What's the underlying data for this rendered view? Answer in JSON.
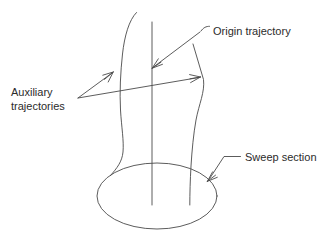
{
  "figure": {
    "type": "engineering-diagram",
    "background_color": "#ffffff",
    "line_color": "#4a4a4a",
    "text_color": "#2b2b2b"
  },
  "labels": {
    "origin_trajectory": "Origin trajectory",
    "auxiliary_line1": "Auxiliary",
    "auxiliary_line2": "trajectories",
    "sweep_section": "Sweep section"
  },
  "geometry": {
    "origin_trajectory_line": "vertical centre line from (152,22) to (152,205)",
    "left_auxiliary_curve": "curve from (136,12) through (120,95) to (110,176)",
    "right_auxiliary_curve": "polyline from (193,44) through (203,80) to (190,205)",
    "sweep_section_ellipse": {
      "center_x": 157,
      "center_y": 196,
      "radius_x": 60,
      "radius_y": 33
    }
  },
  "annotations": [
    {
      "name": "origin-trajectory",
      "label": "Origin trajectory",
      "leader_from": [
        202,
        26
      ],
      "arrow_tip": [
        152,
        68
      ]
    },
    {
      "name": "auxiliary-trajectories",
      "label": "Auxiliary trajectories",
      "leader_origin": [
        78,
        98
      ],
      "arrow_tips": [
        [
          113,
          72
        ],
        [
          200,
          77
        ]
      ]
    },
    {
      "name": "sweep-section",
      "label": "Sweep section",
      "leader_from": [
        238,
        156
      ],
      "arrow_tip": [
        207,
        181
      ]
    }
  ]
}
